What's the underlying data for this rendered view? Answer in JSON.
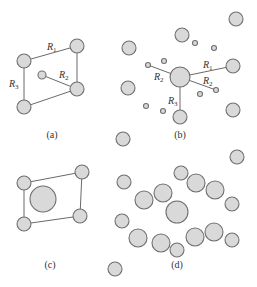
{
  "panels": [
    {
      "id": "a",
      "caption": "(a)",
      "labels": [
        {
          "text": "R",
          "sub": "1"
        },
        {
          "text": "R",
          "sub": "2"
        },
        {
          "text": "R",
          "sub": "3"
        }
      ]
    },
    {
      "id": "b",
      "caption": "(b)",
      "labels": [
        {
          "text": "R",
          "sub": "1"
        },
        {
          "text": "R",
          "sub": "2"
        },
        {
          "text": "R",
          "sub": "2"
        },
        {
          "text": "R",
          "sub": "3"
        }
      ]
    },
    {
      "id": "c",
      "caption": "(c)",
      "labels": []
    },
    {
      "id": "d",
      "caption": "(d)",
      "labels": []
    }
  ],
  "colors": {
    "atom_fill": "#d9d9d9",
    "atom_stroke": "#6f6f6f",
    "line": "#6a6a6a"
  }
}
